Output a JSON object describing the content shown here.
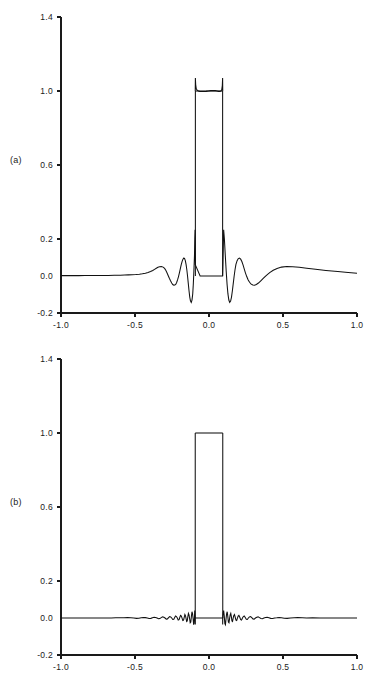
{
  "figure": {
    "background": "#ffffff",
    "line_color": "#111111",
    "text_color": "#1a1a1a",
    "panels": [
      {
        "id": "a",
        "label": "(a)",
        "y_ticks": [
          "1.4",
          "1.0",
          "0.6",
          "0.2",
          "0.0",
          "-0.2"
        ],
        "x_ticks": [
          "-1.0",
          "-0.5",
          "0.0",
          "0.5",
          "1.0"
        ]
      },
      {
        "id": "b",
        "label": "(b)",
        "y_ticks": [
          "1.4",
          "1.0",
          "0.6",
          "0.2",
          "0.0",
          "-0.2"
        ],
        "x_ticks": [
          "-1.0",
          "-0.5",
          "0.0",
          "0.5",
          "1.0"
        ]
      }
    ]
  },
  "chart_data": [
    {
      "type": "line",
      "id": "panel-a",
      "title": "",
      "subtitle": "",
      "xlabel": "",
      "ylabel": "",
      "annotation": "(a)",
      "xlim": [
        -1.0,
        1.0
      ],
      "ylim": [
        -0.2,
        1.4
      ],
      "xticks": [
        -1.0,
        -0.5,
        0.0,
        0.5,
        1.0
      ],
      "xticklabels": [
        "-1.0",
        "-0.5",
        "0.0",
        "0.5",
        "1.0"
      ],
      "yticks": [
        -0.2,
        0.0,
        0.2,
        0.6,
        1.0,
        1.4
      ],
      "yticklabels": [
        "-0.2",
        "0.0",
        "0.2",
        "0.6",
        "1.0",
        "1.4"
      ],
      "grid": false,
      "legend": "none",
      "description": "Rectangular pulse reconstruction with strong Gibbs-type ringing sidelobes",
      "series": [
        {
          "name": "reconstruction-with-ringing",
          "x": [
            -1.0,
            -0.96,
            -0.92,
            -0.88,
            -0.84,
            -0.8,
            -0.76,
            -0.72,
            -0.68,
            -0.64,
            -0.6,
            -0.57,
            -0.545,
            -0.52,
            -0.495,
            -0.47,
            -0.45,
            -0.43,
            -0.412,
            -0.395,
            -0.38,
            -0.368,
            -0.356,
            -0.345,
            -0.334,
            -0.322,
            -0.31,
            -0.3,
            -0.292,
            -0.284,
            -0.276,
            -0.268,
            -0.26,
            -0.252,
            -0.245,
            -0.238,
            -0.231,
            -0.224,
            -0.218,
            -0.212,
            -0.206,
            -0.2,
            -0.194,
            -0.188,
            -0.182,
            -0.176,
            -0.17,
            -0.165,
            -0.16,
            -0.155,
            -0.15,
            -0.145,
            -0.14,
            -0.135,
            -0.13,
            -0.125,
            -0.12,
            -0.115,
            -0.11,
            -0.106,
            -0.102,
            -0.098,
            -0.096,
            -0.094,
            -0.093,
            -0.092,
            -0.06,
            -0.03,
            0.0,
            0.03,
            0.06,
            0.08,
            0.088,
            0.091,
            0.092,
            0.094,
            0.096,
            0.099,
            0.104,
            0.11,
            0.116,
            0.122,
            0.128,
            0.134,
            0.14,
            0.146,
            0.152,
            0.158,
            0.164,
            0.17,
            0.176,
            0.182,
            0.19,
            0.198,
            0.206,
            0.214,
            0.222,
            0.23,
            0.238,
            0.246,
            0.255,
            0.264,
            0.274,
            0.285,
            0.296,
            0.308,
            0.32,
            0.334,
            0.35,
            0.368,
            0.388,
            0.41,
            0.434,
            0.46,
            0.49,
            0.525,
            0.565,
            0.61,
            0.66,
            0.72,
            0.79,
            0.87,
            0.94,
            1.0
          ],
          "y": [
            0.002,
            0.002,
            0.002,
            0.002,
            0.003,
            0.003,
            0.003,
            0.003,
            0.003,
            0.004,
            0.004,
            0.005,
            0.006,
            0.007,
            0.008,
            0.01,
            0.012,
            0.015,
            0.019,
            0.024,
            0.03,
            0.036,
            0.042,
            0.047,
            0.05,
            0.051,
            0.048,
            0.041,
            0.031,
            0.018,
            0.003,
            -0.012,
            -0.026,
            -0.038,
            -0.046,
            -0.05,
            -0.049,
            -0.044,
            -0.034,
            -0.02,
            -0.003,
            0.017,
            0.039,
            0.06,
            0.078,
            0.091,
            0.097,
            0.094,
            0.083,
            0.063,
            0.035,
            0.0,
            -0.04,
            -0.08,
            -0.114,
            -0.136,
            -0.143,
            -0.13,
            -0.097,
            -0.044,
            0.028,
            0.112,
            0.2,
            0.25,
            0.135,
            0.06,
            0.0,
            0.0,
            0.0,
            0.0,
            0.0,
            0.0,
            0.0,
            0.0,
            0.0,
            0.06,
            0.135,
            0.25,
            0.2,
            0.112,
            0.028,
            -0.044,
            -0.097,
            -0.13,
            -0.143,
            -0.136,
            -0.114,
            -0.08,
            -0.04,
            0.0,
            0.035,
            0.063,
            0.083,
            0.094,
            0.097,
            0.091,
            0.078,
            0.06,
            0.039,
            0.017,
            -0.003,
            -0.02,
            -0.034,
            -0.044,
            -0.049,
            -0.05,
            -0.046,
            -0.038,
            -0.026,
            -0.012,
            0.003,
            0.018,
            0.031,
            0.041,
            0.048,
            0.051,
            0.05,
            0.047,
            0.042,
            0.036,
            0.03,
            0.024,
            0.019,
            0.015,
            0.012,
            0.01,
            0.008,
            0.007,
            0.006,
            0.005,
            0.004,
            0.004,
            0.003,
            0.003,
            0.003,
            0.003,
            0.003,
            0.002,
            0.002,
            0.002,
            0.002
          ]
        },
        {
          "name": "pulse-top-overshoot",
          "x": [
            -0.093,
            -0.092,
            -0.09,
            -0.086,
            -0.08,
            -0.072,
            -0.062,
            -0.05,
            -0.036,
            -0.02,
            -0.004,
            0.012,
            0.028,
            0.042,
            0.054,
            0.064,
            0.073,
            0.08,
            0.086,
            0.09,
            0.092,
            0.093
          ],
          "y": [
            1.0,
            1.07,
            1.035,
            1.012,
            1.005,
            1.0,
            0.998,
            0.997,
            0.997,
            0.998,
            1.0,
            1.002,
            1.003,
            1.002,
            1.0,
            0.998,
            0.998,
            1.0,
            1.006,
            1.03,
            1.07,
            1.0
          ]
        },
        {
          "name": "ideal-rect-top",
          "x": [
            -0.092,
            0.092
          ],
          "y": [
            1.0,
            1.0
          ]
        }
      ]
    },
    {
      "type": "line",
      "id": "panel-b",
      "title": "",
      "subtitle": "",
      "xlabel": "",
      "ylabel": "",
      "annotation": "(b)",
      "xlim": [
        -1.0,
        1.0
      ],
      "ylim": [
        -0.2,
        1.4
      ],
      "xticks": [
        -1.0,
        -0.5,
        0.0,
        0.5,
        1.0
      ],
      "xticklabels": [
        "-1.0",
        "-0.5",
        "0.0",
        "0.5",
        "1.0"
      ],
      "yticks": [
        -0.2,
        0.0,
        0.2,
        0.6,
        1.0,
        1.4
      ],
      "yticklabels": [
        "-0.2",
        "0.0",
        "0.2",
        "0.6",
        "1.0",
        "1.4"
      ],
      "grid": false,
      "legend": "none",
      "description": "Rectangular pulse reconstruction with suppressed ringing; only small residual baseline noise",
      "series": [
        {
          "name": "reconstruction-suppressed-ringing",
          "x": [
            -1.0,
            -0.95,
            -0.9,
            -0.85,
            -0.8,
            -0.75,
            -0.7,
            -0.66,
            -0.63,
            -0.6,
            -0.575,
            -0.55,
            -0.528,
            -0.508,
            -0.49,
            -0.474,
            -0.458,
            -0.444,
            -0.43,
            -0.417,
            -0.405,
            -0.393,
            -0.382,
            -0.371,
            -0.361,
            -0.351,
            -0.341,
            -0.332,
            -0.323,
            -0.314,
            -0.305,
            -0.297,
            -0.289,
            -0.281,
            -0.273,
            -0.266,
            -0.259,
            -0.252,
            -0.245,
            -0.238,
            -0.232,
            -0.226,
            -0.22,
            -0.214,
            -0.208,
            -0.202,
            -0.197,
            -0.192,
            -0.187,
            -0.182,
            -0.177,
            -0.172,
            -0.167,
            -0.163,
            -0.159,
            -0.155,
            -0.151,
            -0.147,
            -0.143,
            -0.139,
            -0.135,
            -0.131,
            -0.127,
            -0.123,
            -0.119,
            -0.115,
            -0.111,
            -0.107,
            -0.104,
            -0.101,
            -0.098,
            -0.096,
            -0.095,
            -0.094,
            -0.093,
            -0.0925,
            -0.092,
            -0.06,
            -0.03,
            0.0,
            0.03,
            0.06,
            0.088,
            0.0915,
            0.092,
            0.0925,
            0.093,
            0.094,
            0.096,
            0.099,
            0.103,
            0.107,
            0.111,
            0.115,
            0.119,
            0.123,
            0.127,
            0.131,
            0.135,
            0.139,
            0.143,
            0.147,
            0.151,
            0.155,
            0.159,
            0.163,
            0.167,
            0.172,
            0.177,
            0.182,
            0.187,
            0.192,
            0.197,
            0.202,
            0.208,
            0.214,
            0.22,
            0.226,
            0.232,
            0.238,
            0.245,
            0.252,
            0.259,
            0.266,
            0.273,
            0.281,
            0.289,
            0.297,
            0.305,
            0.314,
            0.323,
            0.332,
            0.341,
            0.351,
            0.361,
            0.371,
            0.382,
            0.393,
            0.405,
            0.417,
            0.43,
            0.444,
            0.458,
            0.474,
            0.49,
            0.508,
            0.528,
            0.55,
            0.575,
            0.6,
            0.63,
            0.66,
            0.7,
            0.75,
            0.8,
            0.85,
            0.9,
            0.95,
            1.0
          ],
          "y": [
            0.0,
            0.0,
            0.0,
            0.0,
            0.0,
            0.0,
            0.0,
            0.0,
            0.001,
            0.001,
            0.001,
            0.002,
            0.001,
            0.0,
            -0.002,
            -0.001,
            0.001,
            0.003,
            0.002,
            0.0,
            -0.003,
            -0.002,
            0.001,
            0.004,
            0.003,
            0.0,
            -0.004,
            -0.003,
            0.002,
            0.006,
            0.004,
            0.0,
            -0.006,
            -0.005,
            0.002,
            0.008,
            0.006,
            0.0,
            -0.008,
            -0.007,
            0.003,
            0.011,
            0.008,
            0.0,
            -0.011,
            -0.009,
            0.004,
            0.014,
            0.01,
            -0.001,
            -0.014,
            -0.012,
            0.005,
            0.019,
            0.013,
            -0.002,
            -0.019,
            -0.016,
            0.007,
            0.025,
            0.017,
            -0.003,
            -0.026,
            -0.022,
            0.009,
            0.034,
            0.022,
            -0.005,
            -0.036,
            -0.03,
            0.012,
            0.04,
            0.03,
            0.01,
            -0.01,
            -0.035,
            0.0,
            0.0,
            0.0,
            0.0,
            0.0,
            0.0,
            0.0,
            0.0,
            0.0,
            -0.035,
            -0.01,
            0.01,
            0.03,
            0.04,
            0.012,
            -0.03,
            -0.036,
            -0.005,
            0.022,
            0.034,
            0.009,
            -0.022,
            -0.026,
            -0.003,
            0.017,
            0.025,
            0.007,
            -0.016,
            -0.019,
            -0.002,
            0.013,
            0.019,
            0.005,
            -0.012,
            -0.014,
            -0.001,
            0.01,
            0.014,
            0.004,
            -0.009,
            -0.011,
            0.0,
            0.008,
            0.011,
            0.003,
            -0.007,
            -0.008,
            0.0,
            0.006,
            0.008,
            0.002,
            -0.005,
            -0.006,
            0.0,
            0.004,
            0.006,
            0.002,
            -0.003,
            -0.004,
            0.0,
            0.003,
            0.004,
            0.001,
            -0.002,
            -0.003,
            0.0,
            0.001,
            0.003,
            0.001,
            -0.001,
            -0.002,
            0.0,
            0.001,
            0.002,
            0.001,
            0.0,
            0.001,
            0.0,
            0.0,
            0.0,
            0.0,
            0.0,
            0.0
          ]
        },
        {
          "name": "pulse-top-clean",
          "x": [
            -0.093,
            -0.06,
            -0.03,
            0.0,
            0.03,
            0.06,
            0.093
          ],
          "y": [
            1.0,
            1.0,
            1.0,
            1.0,
            1.0,
            1.0,
            1.0
          ]
        }
      ]
    }
  ]
}
